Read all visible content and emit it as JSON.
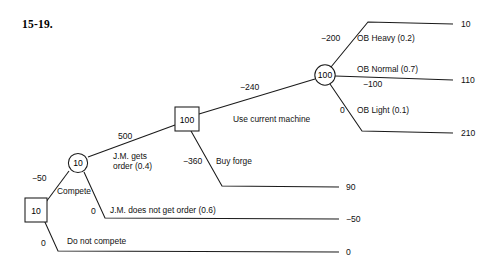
{
  "figure": {
    "label": "15-19."
  },
  "diagram": {
    "type": "decision-tree",
    "nodes": [
      {
        "id": "root",
        "shape": "square",
        "value": "10",
        "x": 35,
        "y": 210
      },
      {
        "id": "compete-chance",
        "shape": "circle",
        "value": "10",
        "x": 78,
        "y": 163
      },
      {
        "id": "machine-decision",
        "shape": "square",
        "value": "100",
        "x": 187,
        "y": 119
      },
      {
        "id": "ob-chance",
        "shape": "circle",
        "value": "100",
        "x": 325,
        "y": 75
      }
    ],
    "branches": [
      {
        "id": "compete",
        "label": "Compete",
        "payoff": "−50"
      },
      {
        "id": "do-not-compete",
        "label": "Do not compete",
        "payoff": "0"
      },
      {
        "id": "jm-gets-order",
        "label": "J.M. gets\norder (0.4)",
        "payoff": "500"
      },
      {
        "id": "jm-no-order",
        "label": "J.M. does not get order (0.6)",
        "payoff": "0"
      },
      {
        "id": "use-current-machine",
        "label": "Use current machine",
        "payoff": "−240"
      },
      {
        "id": "buy-forge",
        "label": "Buy forge",
        "payoff": "−360"
      },
      {
        "id": "ob-heavy",
        "label": "OB Heavy (0.2)",
        "payoff": "−200"
      },
      {
        "id": "ob-normal",
        "label": "OB Normal (0.7)",
        "payoff": "−100"
      },
      {
        "id": "ob-light",
        "label": "OB Light (0.1)",
        "payoff": "0"
      }
    ],
    "terminals": [
      {
        "id": "terminal-ob-heavy",
        "value": "10",
        "x": 463,
        "y": 24
      },
      {
        "id": "terminal-ob-normal",
        "value": "110",
        "x": 463,
        "y": 80
      },
      {
        "id": "terminal-ob-light",
        "value": "210",
        "x": 463,
        "y": 133
      },
      {
        "id": "terminal-buy-forge",
        "value": "90",
        "x": 349,
        "y": 187
      },
      {
        "id": "terminal-jm-no-order",
        "value": "−50",
        "x": 349,
        "y": 219
      },
      {
        "id": "terminal-do-not-compete",
        "value": "0",
        "x": 349,
        "y": 252
      }
    ]
  },
  "labels": {
    "jm_gets_line1": "J.M. gets",
    "jm_gets_line2": "order (0.4)"
  },
  "colors": {
    "line": "#1a1a1a",
    "text": "#111111",
    "background": "#ffffff"
  }
}
